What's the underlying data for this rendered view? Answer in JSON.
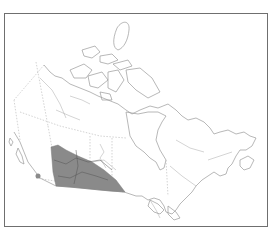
{
  "map": {
    "subject": "Canada distribution range map",
    "colors": {
      "frame": "#6f6f6f",
      "outline": "#9a9a9a",
      "range_fill": "#8a8a8a",
      "background": "#ffffff"
    },
    "range": {
      "region": "southern prairies (Alberta, Saskatchewan, Manitoba)",
      "shading": "gray"
    },
    "isolated_occurrence": {
      "region": "southern British Columbia",
      "marker": "gray-dot"
    }
  }
}
